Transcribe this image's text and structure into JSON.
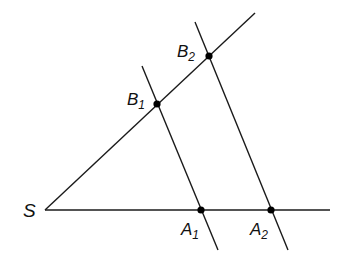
{
  "diagram": {
    "type": "intercept-theorem",
    "stroke_color": "#1a1a1a",
    "point_color": "#000000",
    "vertex": {
      "label": "S"
    },
    "points": [
      {
        "id": "B1",
        "label": "B",
        "sub": "1"
      },
      {
        "id": "B2",
        "label": "B",
        "sub": "2"
      },
      {
        "id": "A1",
        "label": "A",
        "sub": "1"
      },
      {
        "id": "A2",
        "label": "A",
        "sub": "2"
      }
    ]
  }
}
